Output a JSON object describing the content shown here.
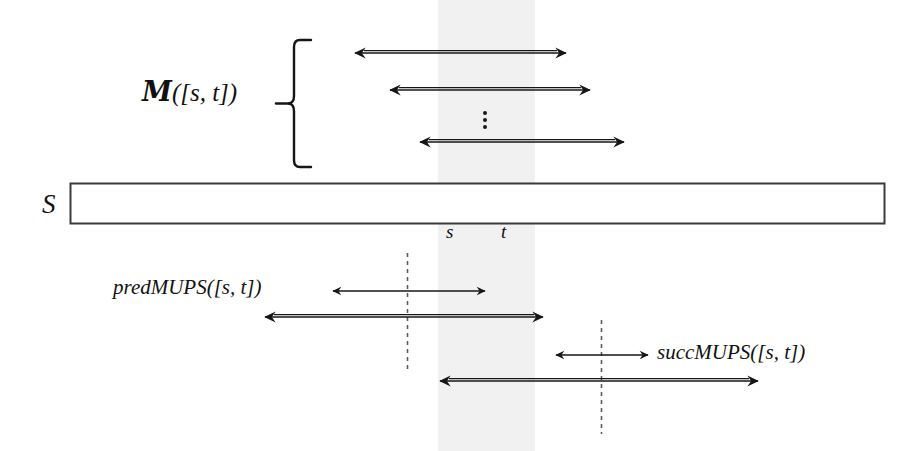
{
  "figure": {
    "background_color": "#ffffff",
    "ink_color": "#111111",
    "band_color": "#f0f0f0",
    "width": 922,
    "height": 451
  },
  "labels": {
    "mups_set": {
      "script": "M",
      "suffix": "([s, t])"
    },
    "string": "S",
    "interval_start": "s",
    "interval_end": "t",
    "pred_mups": "predMUPS([s, t])",
    "succ_mups": "succMUPS([s, t])",
    "ellipsis": "vertical-ellipsis"
  },
  "elements": {
    "string_bar": {
      "x": 70,
      "y": 183,
      "width": 815,
      "height": 41
    },
    "shaded_band": {
      "x": 438,
      "y": 0,
      "width": 97,
      "height": 451
    },
    "brace": {
      "x": 290,
      "y": 38,
      "width": 22,
      "height": 132
    },
    "tick_s": {
      "x": 452,
      "y": 232
    },
    "tick_t": {
      "x": 507,
      "y": 232
    },
    "dashed_line_left": {
      "x": 407,
      "y1": 253,
      "y2": 370
    },
    "dashed_line_right": {
      "x": 601,
      "y1": 320,
      "y2": 434
    }
  },
  "arrows": [
    {
      "name": "mups-arrow-1",
      "x1": 355,
      "x2": 566,
      "y": 53,
      "weight": "double",
      "heads": "both"
    },
    {
      "name": "mups-arrow-2",
      "x1": 390,
      "x2": 590,
      "y": 90,
      "weight": "double",
      "heads": "both"
    },
    {
      "name": "mups-arrow-3",
      "x1": 420,
      "x2": 624,
      "y": 142,
      "weight": "double",
      "heads": "both"
    },
    {
      "name": "pred-arrow-thin",
      "x1": 333,
      "x2": 485,
      "y": 291,
      "weight": "thin",
      "heads": "both"
    },
    {
      "name": "pred-arrow-thick",
      "x1": 265,
      "x2": 543,
      "y": 317,
      "weight": "double",
      "heads": "both"
    },
    {
      "name": "succ-arrow-thin",
      "x1": 556,
      "x2": 648,
      "y": 355,
      "weight": "thin",
      "heads": "both"
    },
    {
      "name": "succ-arrow-thick",
      "x1": 440,
      "x2": 758,
      "y": 381,
      "weight": "double",
      "heads": "both"
    }
  ]
}
